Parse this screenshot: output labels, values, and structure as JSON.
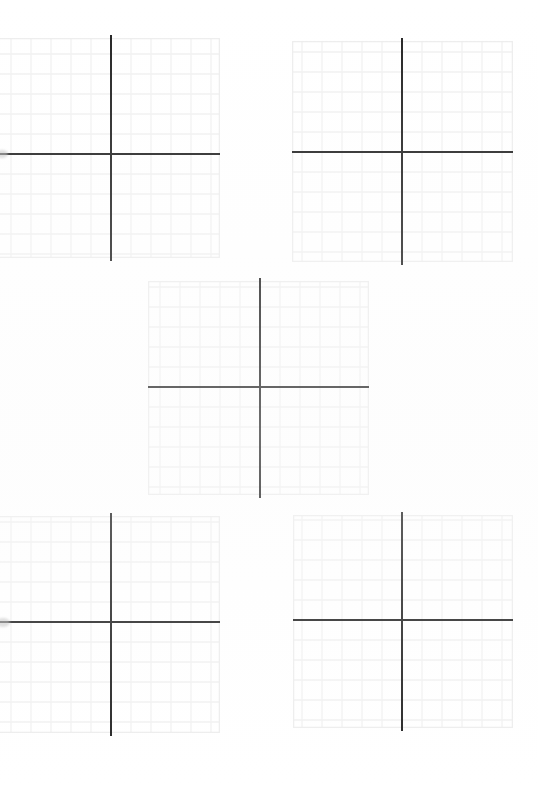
{
  "document": {
    "title": "Coordinate Grid Worksheet",
    "page_background": "#ffffff",
    "paper": "scanned-white",
    "plot_count": 5,
    "layout": "quincunx"
  },
  "style": {
    "grid_line_color": "#f1f1f1",
    "grid_line_color_major": "#ededed",
    "axis_color": "#232323",
    "axis_thickness_px": 2.4,
    "grid_cell_px": 20
  },
  "plots": [
    {
      "name": "plot-top-left",
      "label": "Coordinate grid 1 (top left)",
      "left": -2,
      "top": 38,
      "width": 222,
      "height": 220,
      "origin_x": 113,
      "origin_y": 116,
      "cols": 11,
      "rows": 11,
      "axis_x_extends_left_px": 0,
      "axis_x_extends_right_px": 0,
      "clipped_edge": "left",
      "chart_data": {
        "type": "scatter",
        "title": "",
        "xlabel": "",
        "ylabel": "",
        "xlim": [
          -6,
          5
        ],
        "ylim": [
          -5,
          6
        ],
        "grid": true,
        "series": [],
        "x": [],
        "values": []
      }
    },
    {
      "name": "plot-top-right",
      "left": 292,
      "top": 41,
      "width": 221,
      "height": 221,
      "origin_x": 110,
      "origin_y": 111,
      "cols": 11,
      "rows": 11,
      "clipped_edge": "none",
      "chart_data": {
        "type": "scatter",
        "title": "",
        "xlabel": "",
        "ylabel": "",
        "xlim": [
          -5,
          6
        ],
        "ylim": [
          -5,
          6
        ],
        "grid": true,
        "series": [],
        "x": [],
        "values": []
      }
    },
    {
      "name": "plot-middle-center",
      "left": 148,
      "top": 281,
      "width": 221,
      "height": 214,
      "origin_x": 112,
      "origin_y": 106,
      "cols": 11,
      "rows": 11,
      "clipped_edge": "none",
      "chart_data": {
        "type": "scatter",
        "title": "",
        "xlabel": "",
        "ylabel": "",
        "xlim": [
          -5,
          6
        ],
        "ylim": [
          -5,
          6
        ],
        "grid": true,
        "series": [],
        "x": [],
        "values": []
      }
    },
    {
      "name": "plot-bottom-left",
      "left": -2,
      "top": 516,
      "width": 222,
      "height": 217,
      "origin_x": 113,
      "origin_y": 106,
      "cols": 11,
      "rows": 11,
      "clipped_edge": "left",
      "chart_data": {
        "type": "scatter",
        "title": "",
        "xlabel": "",
        "ylabel": "",
        "xlim": [
          -6,
          5
        ],
        "ylim": [
          -5,
          6
        ],
        "grid": true,
        "series": [],
        "x": [],
        "values": []
      }
    },
    {
      "name": "plot-bottom-right",
      "left": 293,
      "top": 515,
      "width": 220,
      "height": 213,
      "origin_x": 109,
      "origin_y": 105,
      "cols": 11,
      "rows": 11,
      "clipped_edge": "none",
      "chart_data": {
        "type": "scatter",
        "title": "",
        "xlabel": "",
        "ylabel": "",
        "xlim": [
          -5,
          6
        ],
        "ylim": [
          -5,
          6
        ],
        "grid": true,
        "series": [],
        "x": [],
        "values": []
      }
    }
  ],
  "chart_data": {
    "type": "scatter",
    "title": "",
    "subtitle": "",
    "xlabel": "",
    "ylabel": "",
    "legend": [],
    "annotations": [],
    "grid": true,
    "note": "Blank Cartesian coordinate grids — five empty four-quadrant plots with no plotted data, no tick labels, and no axis titles.",
    "plots": 5,
    "grid_cell_px": 20,
    "categories": [],
    "values": []
  }
}
